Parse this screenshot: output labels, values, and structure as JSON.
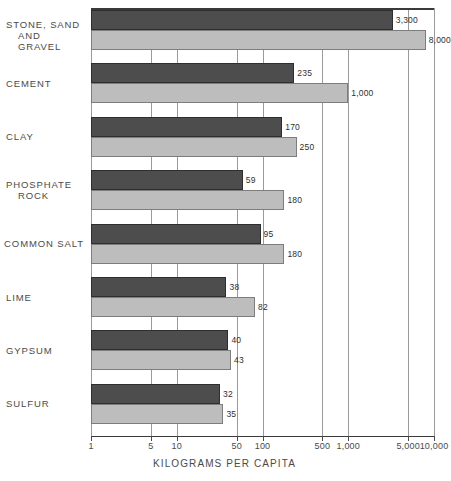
{
  "chart_data": {
    "type": "bar",
    "orientation": "horizontal",
    "title": "",
    "xlabel": "KILOGRAMS PER CAPITA",
    "ylabel": "",
    "scale": "log",
    "xlim": [
      1,
      10000
    ],
    "grid": true,
    "legend": "none",
    "tick_labels": [
      "1",
      "5",
      "10",
      "50",
      "100",
      "500",
      "1,000",
      "5,000",
      "10,000"
    ],
    "tick_values": [
      1,
      5,
      10,
      50,
      100,
      500,
      1000,
      5000,
      10000
    ],
    "categories": [
      "STONE, SAND AND GRAVEL",
      "CEMENT",
      "CLAY",
      "PHOSPHATE ROCK",
      "COMMON SALT",
      "LIME",
      "GYPSUM",
      "SULFUR"
    ],
    "series": [
      {
        "name": "dark",
        "color": "#4d4d4d",
        "values": [
          3300,
          235,
          170,
          59,
          95,
          38,
          40,
          32
        ],
        "labels": [
          "3,300",
          "235",
          "170",
          "59",
          "95",
          "38",
          "40",
          "32"
        ]
      },
      {
        "name": "light",
        "color": "#bdbdbd",
        "values": [
          8000,
          1000,
          250,
          180,
          180,
          82,
          43,
          35
        ],
        "labels": [
          "8,000",
          "1,000",
          "250",
          "180",
          "180",
          "82",
          "43",
          "35"
        ]
      }
    ]
  },
  "category_label_lines": [
    [
      "STONE, SAND",
      "AND GRAVEL"
    ],
    [
      "CEMENT"
    ],
    [
      "CLAY"
    ],
    [
      "PHOSPHATE",
      "ROCK"
    ],
    [
      "COMMON SALT"
    ],
    [
      "LIME"
    ],
    [
      "GYPSUM"
    ],
    [
      "SULFUR"
    ]
  ]
}
